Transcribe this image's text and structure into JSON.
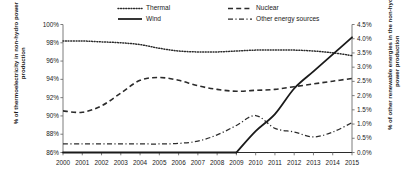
{
  "chart_data": {
    "type": "line",
    "title": "",
    "xlabel": "",
    "categories": [
      2000,
      2001,
      2002,
      2003,
      2004,
      2005,
      2006,
      2007,
      2008,
      2009,
      2010,
      2011,
      2012,
      2013,
      2014,
      2015
    ],
    "left_axis": {
      "label": "% of thermoelectricity in non-hydro power production",
      "ticks": [
        "86%",
        "88%",
        "90%",
        "92%",
        "94%",
        "96%",
        "98%",
        "100%"
      ],
      "tick_values": [
        86,
        88,
        90,
        92,
        94,
        96,
        98,
        100
      ],
      "ylim": [
        86,
        100
      ],
      "tick_step": 2
    },
    "right_axis": {
      "label": "% of other renewable energies in the non-hydro power production",
      "ticks": [
        "0.0%",
        "0.5%",
        "1.0%",
        "1.5%",
        "2.0%",
        "2.5%",
        "3.0%",
        "3.5%",
        "4.0%",
        "4.5%"
      ],
      "tick_values": [
        0.0,
        0.5,
        1.0,
        1.5,
        2.0,
        2.5,
        3.0,
        3.5,
        4.0,
        4.5
      ],
      "ylim": [
        0.0,
        4.5
      ],
      "tick_step": 0.5
    },
    "grid": false,
    "legend_position": "top-center",
    "series": [
      {
        "name": "Thermal",
        "axis": "left",
        "style": "dotted",
        "color": "#2b2b2b",
        "values": [
          98.2,
          98.2,
          98.1,
          98.0,
          97.8,
          97.4,
          97.1,
          97.0,
          97.0,
          97.1,
          97.2,
          97.2,
          97.2,
          97.1,
          96.9,
          96.6
        ]
      },
      {
        "name": "Wind",
        "axis": "right",
        "style": "solid",
        "color": "#1a1a1a",
        "values": [
          0.0,
          0.0,
          0.0,
          0.0,
          0.0,
          0.0,
          0.0,
          0.0,
          0.0,
          0.0,
          0.75,
          1.35,
          2.25,
          2.85,
          3.45,
          4.05
        ]
      },
      {
        "name": "Nuclear",
        "axis": "left",
        "style": "dashed",
        "color": "#2b2b2b",
        "values": [
          90.55,
          90.4,
          91.1,
          92.5,
          93.9,
          94.2,
          93.9,
          93.3,
          92.9,
          92.7,
          92.8,
          92.9,
          93.2,
          93.5,
          93.8,
          94.1
        ]
      },
      {
        "name": "Other energy sources",
        "axis": "right",
        "style": "dashdot",
        "color": "#2b2b2b",
        "values": [
          0.3,
          0.3,
          0.3,
          0.3,
          0.3,
          0.3,
          0.32,
          0.4,
          0.62,
          0.95,
          1.3,
          0.85,
          0.72,
          0.55,
          0.72,
          1.05
        ]
      }
    ],
    "legend": [
      {
        "name": "Thermal",
        "style": "dotted"
      },
      {
        "name": "Wind",
        "style": "solid"
      },
      {
        "name": "Nuclear",
        "style": "dashed"
      },
      {
        "name": "Other energy sources",
        "style": "dashdot"
      }
    ]
  }
}
